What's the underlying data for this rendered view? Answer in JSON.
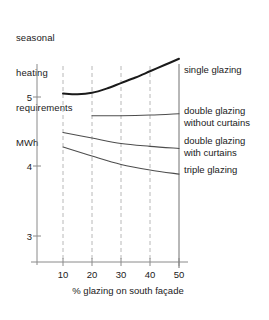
{
  "chart_data": {
    "type": "line",
    "title": "",
    "ylabel": "seasonal heating requirements MWh",
    "ylabel_lines": [
      "seasonal",
      "heating",
      "requirements",
      "MWh"
    ],
    "xlabel": "% glazing on south façade",
    "x": [
      10,
      20,
      30,
      40,
      50
    ],
    "xticks": [
      "10",
      "20",
      "30",
      "40",
      "50"
    ],
    "yticks": [
      "5",
      "4",
      "3"
    ],
    "ytick_values": [
      5,
      4,
      3
    ],
    "xlim": [
      5,
      50
    ],
    "ylim": [
      2.6,
      5.6
    ],
    "grid": "vertical-dashed",
    "legend_position": "right-of-plot-inline",
    "series": [
      {
        "name": "single glazing",
        "label_lines": [
          "single glazing"
        ],
        "x": [
          10,
          15,
          20,
          25,
          30,
          35,
          40,
          45,
          50
        ],
        "values": [
          5.05,
          5.04,
          5.06,
          5.12,
          5.2,
          5.28,
          5.37,
          5.46,
          5.55
        ],
        "color": "#1a1a1a",
        "width": 2.0
      },
      {
        "name": "double glazing without curtains",
        "label_lines": [
          "double glazing",
          "without curtains"
        ],
        "x": [
          20,
          30,
          40,
          50
        ],
        "values": [
          4.73,
          4.73,
          4.74,
          4.76
        ],
        "color": "#4d4d4d",
        "width": 1.1
      },
      {
        "name": "double glazing with curtains",
        "label_lines": [
          "double glazing",
          "with curtains"
        ],
        "x": [
          10,
          20,
          30,
          40,
          50
        ],
        "values": [
          4.49,
          4.41,
          4.33,
          4.29,
          4.26
        ],
        "color": "#4d4d4d",
        "width": 1.1
      },
      {
        "name": "triple glazing",
        "label_lines": [
          "triple glazing"
        ],
        "x": [
          10,
          20,
          30,
          40,
          50
        ],
        "values": [
          4.28,
          4.15,
          4.03,
          3.95,
          3.89
        ],
        "color": "#4d4d4d",
        "width": 1.1
      }
    ],
    "colors": {
      "axis": "#808080",
      "grid": "#b8b8b8",
      "text": "#1a1a1a",
      "background": "#ffffff"
    }
  }
}
